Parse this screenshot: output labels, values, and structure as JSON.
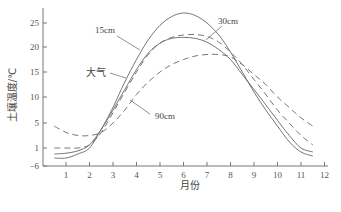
{
  "chart_data": {
    "type": "line",
    "title": "",
    "xlabel": "月份",
    "ylabel": "土壤温度/℃",
    "x": [
      0.5,
      1,
      1.5,
      2,
      2.5,
      3,
      3.5,
      4,
      4.5,
      5,
      5.5,
      6,
      6.5,
      7,
      7.5,
      8,
      8.5,
      9,
      9.5,
      10,
      10.5,
      11,
      11.5
    ],
    "xticks": [
      "1",
      "2",
      "3",
      "4",
      "5",
      "6",
      "7",
      "8",
      "9",
      "10",
      "11",
      "12"
    ],
    "yticks": [
      "-6",
      "1",
      "5",
      "10",
      "15",
      "20",
      "25"
    ],
    "ylim": [
      -6,
      28
    ],
    "grid": false,
    "legend_position": "inline annotations",
    "series": [
      {
        "name": "15cm",
        "style": "solid",
        "values": [
          -1.5,
          -1.5,
          -0.5,
          1,
          4,
          8,
          13,
          17.5,
          21.5,
          24.5,
          26.3,
          27,
          26.5,
          25,
          22.5,
          19,
          15,
          11,
          7.5,
          4.5,
          2,
          0,
          -1
        ]
      },
      {
        "name": "30cm",
        "style": "dashed",
        "values": [
          1,
          1,
          1,
          1.5,
          3.5,
          7,
          11,
          15,
          18.5,
          20.8,
          22,
          22.5,
          22.6,
          22.2,
          21,
          19,
          16.5,
          13.5,
          10.5,
          7.5,
          5,
          3,
          1.5
        ]
      },
      {
        "name": "大气",
        "style": "solid",
        "values": [
          -0.5,
          -0.3,
          0.3,
          1.5,
          4,
          7.5,
          11.5,
          15.5,
          18.8,
          20.8,
          21.8,
          22,
          21.8,
          21,
          19.5,
          17.5,
          14.5,
          11.5,
          8.5,
          5.5,
          3,
          1,
          0
        ]
      },
      {
        "name": "90cm",
        "style": "dashed",
        "values": [
          4.5,
          3.5,
          3,
          3,
          3.5,
          5,
          7.5,
          10.5,
          13,
          15,
          16.5,
          17.5,
          18.2,
          18.5,
          18.5,
          18,
          16.5,
          14.5,
          12.5,
          10,
          8,
          6,
          4.5
        ]
      }
    ],
    "annotations": [
      {
        "text": "15cm"
      },
      {
        "text": "30cm"
      },
      {
        "text": "大气"
      },
      {
        "text": "90cm"
      }
    ]
  },
  "labels": {
    "ylabel": "土壤温度/℃",
    "xlabel": "月份",
    "anno_15": "15cm",
    "anno_30": "30cm",
    "anno_air": "大气",
    "anno_90": "90cm"
  }
}
